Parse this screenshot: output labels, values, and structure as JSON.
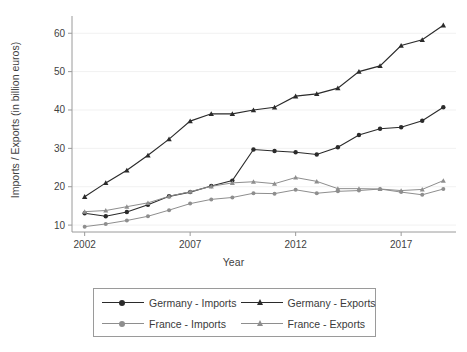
{
  "chart_data": {
    "type": "line",
    "title": "",
    "xlabel": "Year",
    "ylabel": "Imports / Exports (in billion euros)",
    "x": [
      2002,
      2003,
      2004,
      2005,
      2006,
      2007,
      2008,
      2009,
      2010,
      2011,
      2012,
      2013,
      2014,
      2015,
      2016,
      2017,
      2018,
      2019
    ],
    "xticks": [
      "2002",
      "2007",
      "2012",
      "2017"
    ],
    "xtick_values": [
      2002,
      2007,
      2012,
      2017
    ],
    "yticks": [
      "10",
      "20",
      "30",
      "40",
      "50",
      "60"
    ],
    "ytick_values": [
      10,
      20,
      30,
      40,
      50,
      60
    ],
    "xlim": [
      2001.4,
      2019.6
    ],
    "ylim": [
      8.2,
      64.5
    ],
    "grid": false,
    "legend_position": "bottom-outside",
    "series": [
      {
        "name": "Germany - Imports",
        "marker": "circle",
        "color": "#2b2b2b",
        "values": [
          13.1,
          12.3,
          13.4,
          15.3,
          17.5,
          18.6,
          20.2,
          21.6,
          29.7,
          29.3,
          29.0,
          28.4,
          30.3,
          33.5,
          35.1,
          35.5,
          37.2,
          40.7
        ]
      },
      {
        "name": "Germany - Exports",
        "marker": "triangle",
        "color": "#2b2b2b",
        "values": [
          17.4,
          21.0,
          24.3,
          28.2,
          32.4,
          37.1,
          39.0,
          39.0,
          40.0,
          40.7,
          43.6,
          44.2,
          45.7,
          50.0,
          51.5,
          56.8,
          58.3,
          62.1
        ]
      },
      {
        "name": "France - Imports",
        "marker": "circle",
        "color": "#8e8e8e",
        "values": [
          9.6,
          10.3,
          11.2,
          12.3,
          13.9,
          15.6,
          16.7,
          17.2,
          18.3,
          18.2,
          19.2,
          18.3,
          18.8,
          19.0,
          19.4,
          18.6,
          17.9,
          19.4
        ]
      },
      {
        "name": "France - Exports",
        "marker": "triangle",
        "color": "#8e8e8e",
        "values": [
          13.5,
          13.8,
          14.8,
          15.8,
          17.5,
          18.7,
          20.1,
          21.0,
          21.3,
          20.8,
          22.4,
          21.4,
          19.5,
          19.5,
          19.4,
          19.0,
          19.3,
          21.6
        ]
      }
    ]
  },
  "legend": {
    "entries": [
      {
        "label": "Germany - Imports",
        "marker": "circle-marker-dark",
        "color": "#2b2b2b"
      },
      {
        "label": "Germany - Exports",
        "marker": "triangle-marker-dark",
        "color": "#2b2b2b"
      },
      {
        "label": "France - Imports",
        "marker": "circle-marker-gray",
        "color": "#8e8e8e"
      },
      {
        "label": "France - Exports",
        "marker": "triangle-marker-gray",
        "color": "#8e8e8e"
      }
    ]
  },
  "axes": {
    "x_axis_label": "Year",
    "y_axis_label": "Imports / Exports (in billion euros)"
  }
}
